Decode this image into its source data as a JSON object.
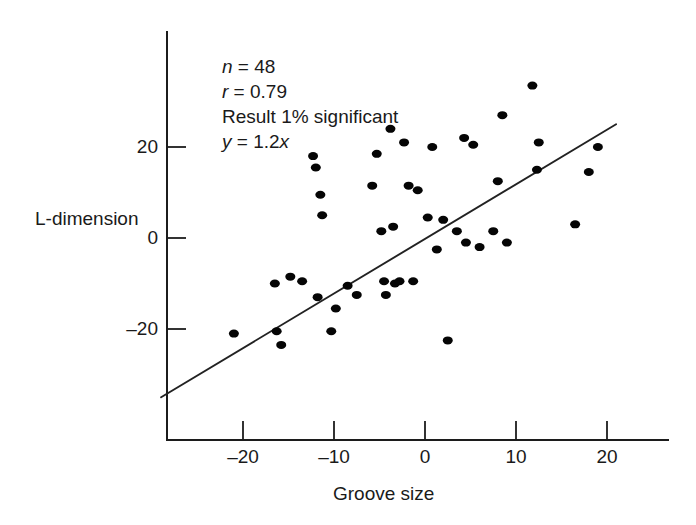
{
  "chart_data": {
    "type": "scatter",
    "title": "",
    "xlabel": "Groove size",
    "ylabel": "L-dimension",
    "xlim": [
      -29,
      22
    ],
    "ylim": [
      -37,
      38
    ],
    "xticks": [
      -20,
      -10,
      0,
      10,
      20
    ],
    "xtick_labels": [
      "–20",
      "–10",
      "0",
      "10",
      "20"
    ],
    "yticks": [
      20,
      0,
      -20
    ],
    "ytick_labels": [
      "20",
      "0",
      "–20"
    ],
    "grid": false,
    "legend": "none",
    "marker_color": "#050505",
    "line_color": "#222222",
    "axis_color": "#1c1c1c",
    "n_points": 48,
    "correlation": 0.79,
    "fit_equation": "y = 1.2x",
    "fit_slope": 1.2,
    "fit_intercept": 0,
    "fit_line_endpoints": [
      [
        -29,
        -35
      ],
      [
        21,
        25
      ]
    ],
    "points": [
      [
        -21.0,
        -21.0
      ],
      [
        -16.5,
        -10.0
      ],
      [
        -16.3,
        -20.5
      ],
      [
        -15.8,
        -23.5
      ],
      [
        -14.8,
        -8.5
      ],
      [
        -13.5,
        -9.5
      ],
      [
        -12.3,
        18.0
      ],
      [
        -12.0,
        15.5
      ],
      [
        -11.8,
        -13.0
      ],
      [
        -11.5,
        9.5
      ],
      [
        -11.3,
        5.0
      ],
      [
        -10.3,
        -20.5
      ],
      [
        -9.8,
        -15.5
      ],
      [
        -8.5,
        -10.5
      ],
      [
        -7.5,
        -12.5
      ],
      [
        -5.8,
        11.5
      ],
      [
        -5.3,
        18.5
      ],
      [
        -4.8,
        1.5
      ],
      [
        -4.5,
        -9.5
      ],
      [
        -4.3,
        -12.5
      ],
      [
        -3.8,
        24.0
      ],
      [
        -3.5,
        2.5
      ],
      [
        -3.3,
        -10.0
      ],
      [
        -2.8,
        -9.5
      ],
      [
        -2.3,
        21.0
      ],
      [
        -1.8,
        11.5
      ],
      [
        -1.3,
        -9.5
      ],
      [
        -0.8,
        10.5
      ],
      [
        0.3,
        4.5
      ],
      [
        0.8,
        20.0
      ],
      [
        1.3,
        -2.5
      ],
      [
        2.0,
        4.0
      ],
      [
        2.5,
        -22.5
      ],
      [
        3.5,
        1.5
      ],
      [
        4.3,
        22.0
      ],
      [
        4.5,
        -1.0
      ],
      [
        5.3,
        20.5
      ],
      [
        6.0,
        -2.0
      ],
      [
        7.5,
        1.5
      ],
      [
        8.0,
        12.5
      ],
      [
        8.5,
        27.0
      ],
      [
        9.0,
        -1.0
      ],
      [
        11.8,
        33.5
      ],
      [
        12.3,
        15.0
      ],
      [
        12.5,
        21.0
      ],
      [
        16.5,
        3.0
      ],
      [
        18.0,
        14.5
      ],
      [
        19.0,
        20.0
      ]
    ],
    "annotations": [
      {
        "prefix_italic": "n",
        "rest": " = 48"
      },
      {
        "prefix_italic": "r",
        "rest": " = 0.79"
      },
      {
        "prefix_italic": "",
        "rest": "Result 1% significant"
      },
      {
        "prefix_italic": "y",
        "rest": " = 1.2",
        "suffix_italic": "x"
      }
    ]
  },
  "annotation_text": {
    "line1_var": "n",
    "line1_rest": " = 48",
    "line2_var": "r",
    "line2_rest": " = 0.79",
    "line3": "Result 1% significant",
    "line4_var": "y",
    "line4_rest": " = 1.2",
    "line4_var2": "x"
  },
  "axis_titles": {
    "y": "L-dimension",
    "x": "Groove size"
  },
  "tick_text": {
    "y_20": "20",
    "y_0": "0",
    "y_neg20": "–20",
    "x_neg20": "–20",
    "x_neg10": "–10",
    "x_0": "0",
    "x_10": "10",
    "x_20": "20"
  }
}
